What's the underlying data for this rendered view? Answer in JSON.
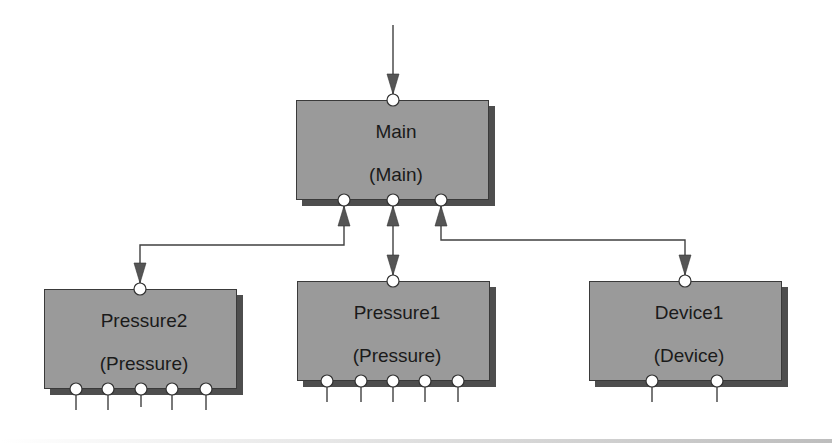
{
  "diagram": {
    "type": "block-hierarchy",
    "colors": {
      "box_fill": "#9a9a9a",
      "box_shadow": "#4e4e4e",
      "line": "#404040",
      "arrow": "#555555",
      "port_fill": "#ffffff",
      "text": "#1a1a1a"
    },
    "nodes": [
      {
        "id": "main",
        "name": "Main",
        "type": "(Main)",
        "top_ports": 1,
        "bottom_ports": 3
      },
      {
        "id": "pressure2",
        "name": "Pressure2",
        "type": "(Pressure)",
        "top_ports": 1,
        "bottom_ports": 5
      },
      {
        "id": "pressure1",
        "name": "Pressure1",
        "type": "(Pressure)",
        "top_ports": 1,
        "bottom_ports": 5
      },
      {
        "id": "device1",
        "name": "Device1",
        "type": "(Device)",
        "top_ports": 1,
        "bottom_ports": 2
      }
    ],
    "edges": [
      {
        "from": "external",
        "to": "main",
        "direction": "into-main-top"
      },
      {
        "from": "main",
        "to": "pressure2",
        "direction": "bidirectional"
      },
      {
        "from": "main",
        "to": "pressure1",
        "direction": "bidirectional"
      },
      {
        "from": "main",
        "to": "device1",
        "direction": "bidirectional"
      }
    ]
  }
}
